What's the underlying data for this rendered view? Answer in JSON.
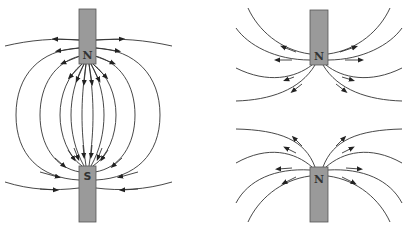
{
  "diagram": {
    "panels": [
      {
        "id": "opposite-poles",
        "magnets": [
          {
            "pole_label": "N",
            "position": "top"
          },
          {
            "pole_label": "S",
            "position": "bottom"
          }
        ],
        "field_direction": "from N to S"
      },
      {
        "id": "like-poles",
        "magnets": [
          {
            "pole_label": "N",
            "position": "top"
          },
          {
            "pole_label": "N",
            "position": "bottom"
          }
        ],
        "field_direction": "away from both N poles"
      }
    ]
  },
  "labels": {
    "left_top": "N",
    "left_bottom": "S",
    "right_top": "N",
    "right_bottom": "N"
  },
  "colors": {
    "magnet_fill": "#9a9a9a",
    "line": "#333333",
    "background": "#ffffff"
  }
}
